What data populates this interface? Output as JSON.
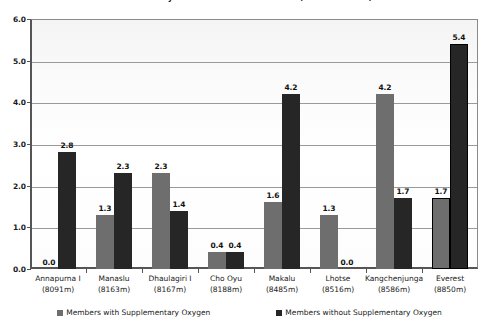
{
  "chart_data": {
    "type": "bar",
    "title": "Deaths by Members on 8000m Peaks (% of Members)",
    "xlabel": "",
    "ylabel": "",
    "ylim": [
      0.0,
      6.0
    ],
    "ytick_step": 1.0,
    "ytick_labels": [
      "0.0",
      "1.0",
      "2.0",
      "3.0",
      "4.0",
      "5.0",
      "6.0"
    ],
    "grid": true,
    "legend_position": "bottom",
    "categories": [
      "Annapurna I",
      "Manaslu",
      "Dhaulagiri I",
      "Cho Oyu",
      "Makalu",
      "Lhotse",
      "Kangchenjunga",
      "Everest"
    ],
    "category_sublabels": [
      "(8091m)",
      "(8163m)",
      "(8167m)",
      "(8188m)",
      "(8485m)",
      "(8516m)",
      "(8586m)",
      "(8850m)"
    ],
    "series": [
      {
        "name": "Members with Supplementary Oxygen",
        "color": "#6e6e6e",
        "values": [
          0.0,
          1.3,
          2.3,
          0.4,
          1.6,
          1.3,
          4.2,
          1.7
        ],
        "labels": [
          "0.0",
          "1.3",
          "2.3",
          "0.4",
          "1.6",
          "1.3",
          "4.2",
          "1.7"
        ],
        "highlight_index": 7
      },
      {
        "name": "Members without Supplementary Oxygen",
        "color": "#262626",
        "values": [
          2.8,
          2.3,
          1.4,
          0.4,
          4.2,
          0.0,
          1.7,
          5.4
        ],
        "labels": [
          "2.8",
          "2.3",
          "1.4",
          "0.4",
          "4.2",
          "0.0",
          "1.7",
          "5.4"
        ],
        "highlight_index": 7
      }
    ]
  },
  "legend": {
    "items": [
      "Members with Supplementary Oxygen",
      "Members without Supplementary Oxygen"
    ]
  }
}
